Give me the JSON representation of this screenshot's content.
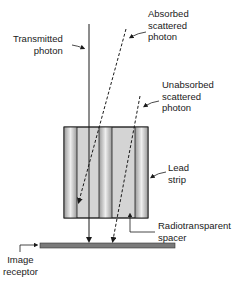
{
  "diagram": {
    "labels": {
      "transmitted_photon": "Transmitted\nphoton",
      "absorbed_scattered_photon": "Absorbed\nscattered\nphoton",
      "unabsorbed_scattered_photon": "Unabsorbed\nscattered\nphoton",
      "lead_strip": "Lead\nstrip",
      "radiotransparent_spacer": "Radiotransparent\nspacer",
      "image_receptor": "Image\nreceptor"
    },
    "colors": {
      "line": "#1a1a1a",
      "lead_strip_dark": "#8a8a8a",
      "lead_strip_light": "#e8e8e8",
      "spacer": "#d4d4d4",
      "receptor": "#7a7a7a"
    }
  }
}
